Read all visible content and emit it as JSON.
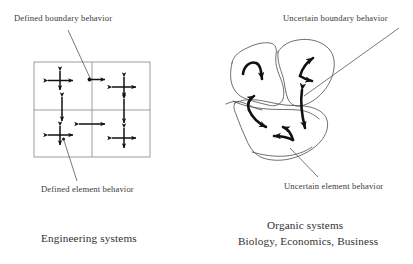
{
  "figure": {
    "background": "#ffffff",
    "ink": "#2b2b2b",
    "arrow_color": "#111111",
    "grid_line_color": "#8c8c8c",
    "leader_color": "#555555"
  },
  "labels": {
    "defined_boundary": "Defined boundary behavior",
    "defined_element": "Defined element behavior",
    "uncertain_boundary": "Uncertain boundary behavior",
    "uncertain_element": "Uncertain element behavior",
    "engineering_caption": "Engineering systems",
    "organic_caption_line1": "Organic systems",
    "organic_caption_line2": "Biology, Economics, Business"
  },
  "left_diagram": {
    "name": "engineering-grid",
    "description": "Rectangular grid of six cells with straight double-headed cross arrows",
    "grid": {
      "x": 34,
      "y": 62,
      "width": 116,
      "height": 95,
      "columns": 3,
      "rows": 2,
      "column_dividers_x": [
        92,
        150
      ],
      "row_divider_y": [
        110
      ]
    },
    "elements": [
      {
        "id": "cross-1",
        "cx": 60,
        "cy": 80,
        "arms": [
          "up",
          "down",
          "left",
          "right"
        ]
      },
      {
        "id": "cross-2",
        "cx": 92,
        "cy": 80,
        "arms": [
          "right"
        ]
      },
      {
        "id": "cross-3",
        "cx": 123,
        "cy": 87,
        "arms": [
          "up",
          "down",
          "left",
          "right"
        ]
      },
      {
        "id": "cross-4",
        "cx": 62,
        "cy": 108,
        "arms": [
          "up",
          "down"
        ]
      },
      {
        "id": "cross-5",
        "cx": 123,
        "cy": 110,
        "arms": [
          "up",
          "down"
        ]
      },
      {
        "id": "cross-6",
        "cx": 92,
        "cy": 124,
        "arms": [
          "left",
          "right"
        ]
      },
      {
        "id": "cross-7",
        "cx": 60,
        "cy": 135,
        "arms": [
          "up",
          "down",
          "left",
          "right"
        ]
      },
      {
        "id": "cross-8",
        "cx": 123,
        "cy": 138,
        "arms": [
          "up",
          "down",
          "left",
          "right"
        ]
      }
    ],
    "leaders": [
      {
        "id": "leader-defined-boundary",
        "from": [
          68,
          30
        ],
        "to": [
          91,
          79
        ]
      },
      {
        "id": "leader-defined-element",
        "from": [
          77,
          182
        ],
        "to": [
          63,
          140
        ]
      }
    ]
  },
  "right_diagram": {
    "name": "organic-blobs",
    "description": "Three irregular hand-drawn blob regions with freehand curved arrows",
    "blobs": 3,
    "arrows": [
      {
        "id": "curve-arrow-1",
        "region": "top-left blob",
        "shape": "hook-down"
      },
      {
        "id": "curve-arrow-2",
        "region": "top-right blob",
        "shape": "hook-up-left-and-right"
      },
      {
        "id": "curve-arrow-3",
        "region": "left-middle",
        "shape": "fork-up-and-down-right"
      },
      {
        "id": "curve-arrow-4",
        "region": "center-seam",
        "shape": "vertical-double"
      },
      {
        "id": "curve-arrow-5",
        "region": "lower blob",
        "shape": "hook-left-and-up"
      }
    ],
    "leaders": [
      {
        "id": "leader-uncertain-boundary",
        "from": [
          398,
          28
        ],
        "to": [
          305,
          97
        ]
      },
      {
        "id": "leader-uncertain-element",
        "from": [
          318,
          178
        ],
        "to": [
          288,
          148
        ]
      }
    ]
  }
}
